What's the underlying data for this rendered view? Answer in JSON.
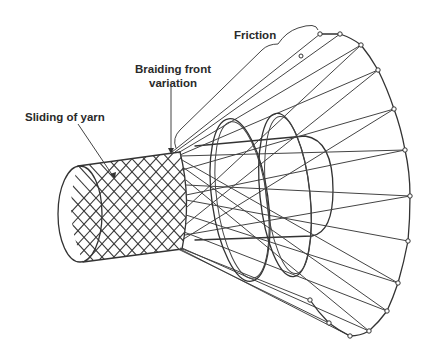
{
  "figure": {
    "labels": {
      "friction": "Friction",
      "braiding_front_line1": "Braiding front",
      "braiding_front_line2": "variation",
      "sliding_of_yarn": "Sliding of yarn"
    },
    "colors": {
      "line": "#333333",
      "background": "#ffffff",
      "text": "#2a2a2a"
    }
  }
}
